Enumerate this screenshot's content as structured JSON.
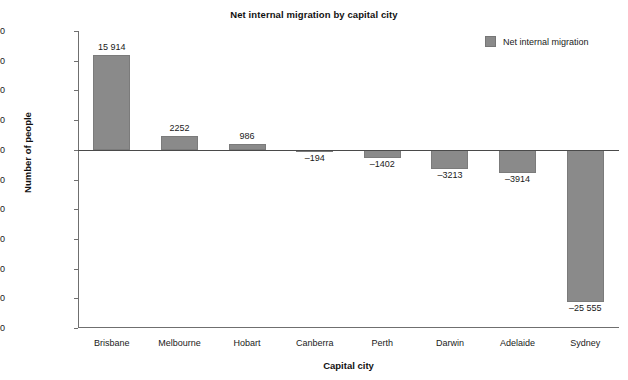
{
  "chart_data": {
    "type": "bar",
    "title": "Net internal migration by capital city",
    "xlabel": "Capital city",
    "ylabel": "Number of people",
    "categories": [
      "Brisbane",
      "Melbourne",
      "Hobart",
      "Canberra",
      "Perth",
      "Darwin",
      "Adelaide",
      "Sydney"
    ],
    "values": [
      15914,
      2252,
      986,
      -194,
      -1402,
      -3213,
      -3914,
      -25555
    ],
    "value_labels": [
      "15 914",
      "2252",
      "986",
      "–194",
      "–1402",
      "–3213",
      "–3914",
      "–25 555"
    ],
    "ylim": [
      -30000,
      20000
    ],
    "ytick_values": [
      20000,
      15000,
      10000,
      5000,
      0,
      -5000,
      -10000,
      -15000,
      -20000,
      -25000,
      -30000
    ],
    "ytick_labels": [
      "20 000",
      "15 000",
      "10 000",
      "5000",
      "0",
      "–5000",
      "–10 000",
      "–15 000",
      "–20 000",
      "–25 000",
      "–30 000"
    ],
    "grid": false,
    "legend_position": "top-right",
    "series": [
      {
        "name": "Net internal migration",
        "color": "#8a8a8a"
      }
    ]
  },
  "legend": {
    "entries": [
      {
        "label": "Net internal migration",
        "color": "#8a8a8a"
      }
    ]
  },
  "colors": {
    "bar_fill": "#8a8a8a",
    "bar_stroke": "#7b7b7b",
    "axis": "#6f6f6f",
    "zero_line": "#4a4a4a",
    "text": "#1a1a1a",
    "background": "#ffffff"
  }
}
